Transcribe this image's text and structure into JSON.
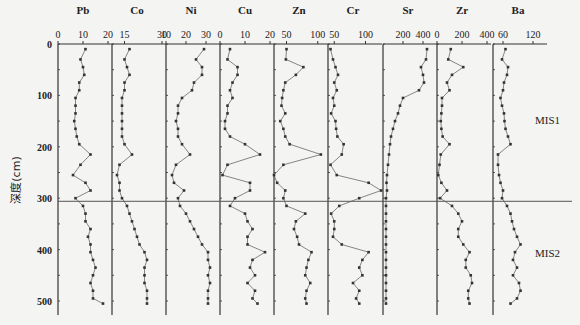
{
  "chart_data": {
    "type": "line",
    "orientation": "depth-profile",
    "ylabel": "深度(cm)",
    "y_ticks": [
      0,
      100,
      200,
      300,
      400,
      500
    ],
    "ylim": [
      0,
      515
    ],
    "y_inverted": true,
    "boundary_depth": 306,
    "zones": [
      {
        "label": "MIS1",
        "depth": 160
      },
      {
        "label": "MIS2",
        "depth": 415
      }
    ],
    "depths": [
      10,
      30,
      45,
      60,
      75,
      90,
      105,
      120,
      135,
      150,
      165,
      180,
      195,
      215,
      235,
      255,
      270,
      285,
      300,
      315,
      330,
      345,
      360,
      375,
      390,
      405,
      420,
      435,
      450,
      465,
      480,
      495,
      505
    ],
    "panels": [
      {
        "name": "Pb",
        "xlim": [
          0,
          20
        ],
        "ticks": [
          0,
          10,
          20
        ],
        "values": [
          11,
          9,
          10,
          10.5,
          8.5,
          8.5,
          7,
          7,
          7,
          6.5,
          7,
          7.5,
          8.5,
          13,
          9,
          6,
          11,
          13,
          7,
          10,
          11,
          11,
          13,
          12,
          13,
          13,
          14,
          15,
          14,
          13,
          14,
          14,
          18
        ]
      },
      {
        "name": "Co",
        "xlim": [
          10,
          30
        ],
        "ticks": [
          15,
          30
        ],
        "values": [
          17,
          15,
          16,
          17,
          15,
          15,
          14,
          14,
          14,
          14,
          14,
          14,
          15,
          18,
          13,
          12,
          13,
          13,
          14,
          16,
          17,
          18,
          19,
          20,
          21,
          23,
          24,
          23,
          23,
          23,
          24,
          24,
          24
        ]
      },
      {
        "name": "Ni",
        "xlim": [
          10,
          35
        ],
        "ticks": [
          10,
          20,
          30
        ],
        "values": [
          29,
          25,
          28,
          28,
          24,
          23,
          18,
          16,
          16,
          15,
          16,
          16,
          18,
          22,
          15,
          13,
          14,
          19,
          16,
          17,
          20,
          22,
          24,
          26,
          28,
          31,
          31,
          32,
          31,
          32,
          31,
          31,
          31
        ]
      },
      {
        "name": "Cu",
        "xlim": [
          0,
          20
        ],
        "ticks": [
          0,
          10,
          20
        ],
        "values": [
          4,
          3,
          7,
          7,
          5,
          4,
          5,
          3,
          3,
          2,
          2,
          4,
          10,
          16,
          3,
          1,
          12,
          12,
          6,
          4,
          10,
          11,
          13,
          11,
          11,
          18,
          13,
          12,
          14,
          11,
          14,
          13,
          15
        ]
      },
      {
        "name": "Zn",
        "xlim": [
          30,
          110
        ],
        "ticks": [
          50,
          100
        ],
        "values": [
          50,
          49,
          77,
          65,
          48,
          45,
          43,
          42,
          48,
          40,
          45,
          48,
          55,
          105,
          45,
          30,
          35,
          48,
          45,
          50,
          80,
          65,
          62,
          67,
          70,
          90,
          85,
          82,
          80,
          88,
          82,
          80,
          82
        ]
      },
      {
        "name": "Cr",
        "xlim": [
          40,
          120
        ],
        "ticks": [
          50,
          100
        ],
        "values": [
          44,
          48,
          52,
          56,
          50,
          54,
          48,
          50,
          45,
          52,
          53,
          55,
          65,
          62,
          44,
          54,
          105,
          125,
          90,
          58,
          45,
          50,
          50,
          48,
          62,
          105,
          95,
          90,
          95,
          80,
          90,
          85,
          90
        ]
      },
      {
        "name": "Sr",
        "xlim": [
          0,
          500
        ],
        "ticks": [
          200,
          400
        ],
        "values": [
          440,
          430,
          380,
          400,
          410,
          360,
          200,
          170,
          150,
          120,
          100,
          80,
          70,
          60,
          50,
          40,
          35,
          40,
          30,
          30,
          30,
          30,
          30,
          30,
          30,
          30,
          30,
          30,
          30,
          30,
          30,
          30,
          30
        ]
      },
      {
        "name": "Zr",
        "xlim": [
          0,
          400
        ],
        "ticks": [
          0,
          200,
          400
        ],
        "values": [
          110,
          90,
          210,
          120,
          80,
          100,
          40,
          40,
          35,
          30,
          35,
          45,
          100,
          30,
          20,
          10,
          35,
          80,
          25,
          120,
          170,
          200,
          170,
          170,
          210,
          260,
          230,
          230,
          270,
          280,
          250,
          250,
          260
        ]
      },
      {
        "name": "Ba",
        "xlim": [
          40,
          140
        ],
        "ticks": [
          60,
          120
        ],
        "values": [
          65,
          58,
          70,
          68,
          62,
          60,
          55,
          58,
          62,
          63,
          65,
          70,
          75,
          50,
          50,
          52,
          55,
          60,
          58,
          68,
          75,
          78,
          82,
          88,
          95,
          84,
          80,
          88,
          80,
          92,
          95,
          88,
          75
        ]
      }
    ]
  },
  "labels": {
    "y_axis_title": "深度(cm)",
    "mis1": "MIS1",
    "mis2": "MIS2"
  }
}
